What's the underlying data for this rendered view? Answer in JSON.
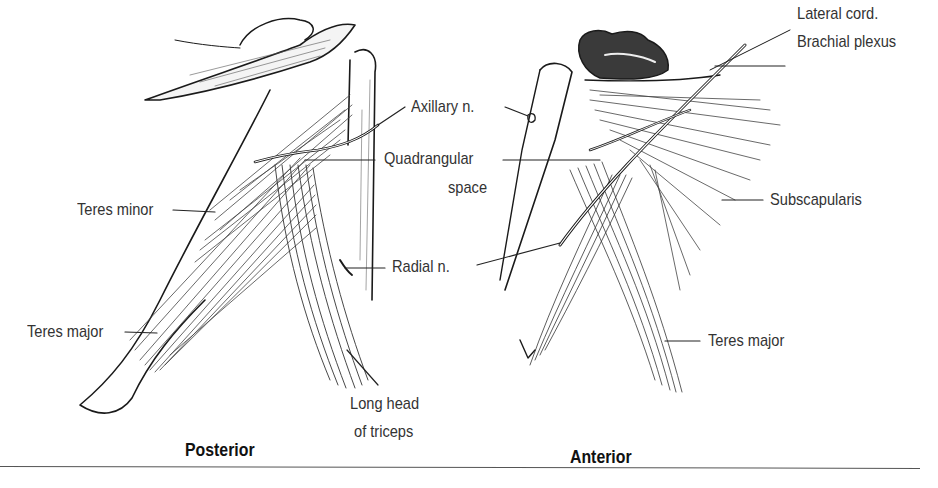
{
  "figure": {
    "panels": [
      {
        "title": "Posterior",
        "labels": {
          "axillary": "Axillary n.",
          "quadrangular_1": "Quadrangular",
          "quadrangular_2": "space",
          "teres_minor": "Teres minor",
          "teres_major": "Teres major",
          "radial": "Radial n.",
          "long_head_1": "Long head",
          "long_head_2": "of triceps"
        }
      },
      {
        "title": "Anterior",
        "labels": {
          "lateral_cord_1": "Lateral cord.",
          "lateral_cord_2": "Brachial plexus",
          "subscapularis": "Subscapularis",
          "teres_major": "Teres major"
        }
      }
    ],
    "colors": {
      "ink": "#1a1a1a",
      "label": "#333333",
      "rule": "#555555"
    }
  }
}
